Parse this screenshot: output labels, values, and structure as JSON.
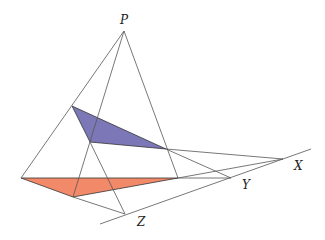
{
  "colors": {
    "line": "#555555",
    "upper_triangle_fill": "#7c78b8",
    "lower_triangle_fill": "#f28a6a",
    "background": "#ffffff"
  },
  "points": {
    "P": {
      "label": "P",
      "x": 124,
      "y": 31
    },
    "X": {
      "label": "X",
      "x": 283,
      "y": 159
    },
    "Y": {
      "label": "Y",
      "x": 231,
      "y": 178
    },
    "Z": {
      "label": "Z",
      "x": 125,
      "y": 214
    }
  },
  "upper_triangle": {
    "a": [
      72,
      106
    ],
    "b": [
      90,
      142
    ],
    "c": [
      166,
      149
    ]
  },
  "lower_triangle": {
    "a": [
      21,
      178
    ],
    "b": [
      73,
      197
    ],
    "c": [
      178,
      178
    ]
  },
  "labels": {
    "P": "P",
    "X": "X",
    "Y": "Y",
    "Z": "Z"
  }
}
